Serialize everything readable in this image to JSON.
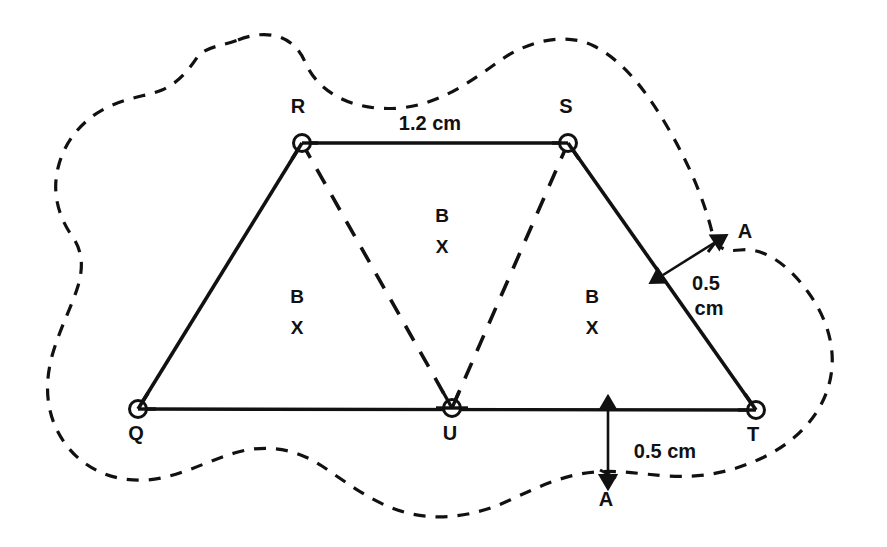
{
  "figure": {
    "background_color": "#ffffff",
    "line_color": "#111111",
    "vertices": [
      {
        "id": "Q",
        "label": "Q",
        "x": 138,
        "y": 409,
        "label_x": 136,
        "label_y": 440,
        "marker": "open-circle"
      },
      {
        "id": "R",
        "label": "R",
        "x": 302,
        "y": 143,
        "label_x": 298,
        "label_y": 113,
        "marker": "open-circle"
      },
      {
        "id": "S",
        "label": "S",
        "x": 568,
        "y": 143,
        "label_x": 566,
        "label_y": 113,
        "marker": "open-circle"
      },
      {
        "id": "T",
        "label": "T",
        "x": 756,
        "y": 410,
        "label_x": 753,
        "label_y": 441,
        "marker": "open-circle"
      },
      {
        "id": "U",
        "label": "U",
        "x": 452,
        "y": 408,
        "label_x": 450,
        "label_y": 440,
        "marker": "open-circle"
      }
    ],
    "solid_edges": [
      {
        "name": "edge-R-S",
        "from": "R",
        "to": "S"
      },
      {
        "name": "edge-Q-R",
        "from": "Q",
        "to": "R"
      },
      {
        "name": "edge-S-T",
        "from": "S",
        "to": "T"
      },
      {
        "name": "edge-Q-T",
        "from": "Q",
        "to": "T"
      }
    ],
    "dashed_edges": [
      {
        "name": "edge-R-U",
        "from": "R",
        "to": "U"
      },
      {
        "name": "edge-S-U",
        "from": "S",
        "to": "U"
      }
    ],
    "region_labels": [
      {
        "name": "region-label-left",
        "top": "B",
        "bottom": "X",
        "x": 297,
        "y_top": 303,
        "y_bottom": 334
      },
      {
        "name": "region-label-middle",
        "top": "B",
        "bottom": "X",
        "x": 442,
        "y_top": 222,
        "y_bottom": 253
      },
      {
        "name": "region-label-right",
        "top": "B",
        "bottom": "X",
        "x": 592,
        "y_top": 303,
        "y_bottom": 334
      }
    ],
    "dimensions": [
      {
        "name": "dimension-top",
        "text": "1.2 cm",
        "lines": [
          "1.2 cm"
        ],
        "x": 430,
        "y": 130
      },
      {
        "name": "dimension-right",
        "text": "0.5 cm",
        "lines": [
          "0.5",
          "cm"
        ],
        "x": 706,
        "y_line1": 290,
        "y_line2": 315,
        "arrow": {
          "x1": 663,
          "y1": 275,
          "x2": 714,
          "y2": 243
        }
      },
      {
        "name": "dimension-bottom",
        "text": "0.5 cm",
        "lines": [
          "0.5 cm"
        ],
        "x": 625,
        "y": 458,
        "arrow": {
          "x1": 608,
          "y1": 411,
          "x2": 608,
          "y2": 474
        }
      }
    ],
    "boundary_points": [
      {
        "name": "point-A-right",
        "label": "A",
        "x": 714,
        "y": 243,
        "label_x": 745,
        "label_y": 238
      },
      {
        "name": "point-A-bottom",
        "label": "A",
        "x": 608,
        "y": 474,
        "label_x": 606,
        "label_y": 506
      }
    ],
    "outer_curve": {
      "name": "dashed-boundary-curve",
      "style": "dashed",
      "description": "irregular closed blob surrounding the figure"
    }
  }
}
